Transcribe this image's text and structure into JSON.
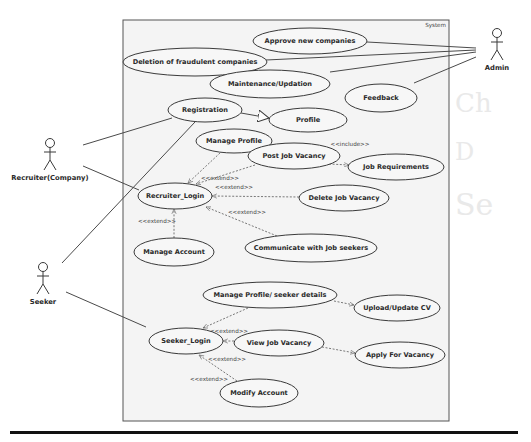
{
  "diagram": {
    "type": "uml-use-case",
    "system": {
      "label": "System",
      "box": {
        "x": 123,
        "y": 20,
        "w": 326,
        "h": 401
      }
    },
    "actors": [
      {
        "id": "admin",
        "label": "Admin",
        "x": 497,
        "y": 28
      },
      {
        "id": "recruiter",
        "label": "Recruiter(Company)",
        "x": 50,
        "y": 138
      },
      {
        "id": "seeker",
        "label": "Seeker",
        "x": 43,
        "y": 262
      }
    ],
    "use_cases": [
      {
        "id": "approve",
        "label": "Approve new companies",
        "cx": 310,
        "cy": 41,
        "rx": 57,
        "ry": 13
      },
      {
        "id": "deletion",
        "label": "Deletion of fraudulent companies",
        "cx": 195,
        "cy": 62,
        "rx": 72,
        "ry": 14
      },
      {
        "id": "maintenance",
        "label": "Maintenance/Updation",
        "cx": 270,
        "cy": 84,
        "rx": 60,
        "ry": 14
      },
      {
        "id": "feedback",
        "label": "Feedback",
        "cx": 381,
        "cy": 98,
        "rx": 36,
        "ry": 14
      },
      {
        "id": "registration",
        "label": "Registration",
        "cx": 205,
        "cy": 110,
        "rx": 37,
        "ry": 12
      },
      {
        "id": "profile",
        "label": "Profile",
        "cx": 308,
        "cy": 120,
        "rx": 39,
        "ry": 12
      },
      {
        "id": "manage_profile",
        "label": "Manage Profile",
        "cx": 234,
        "cy": 141,
        "rx": 38,
        "ry": 12
      },
      {
        "id": "post_job",
        "label": "Post Job Vacancy",
        "cx": 294,
        "cy": 156,
        "rx": 46,
        "ry": 13
      },
      {
        "id": "job_req",
        "label": "Job Requirements",
        "cx": 396,
        "cy": 167,
        "rx": 48,
        "ry": 13
      },
      {
        "id": "recruiter_login",
        "label": "Recruiter_Login",
        "cx": 175,
        "cy": 196,
        "rx": 37,
        "ry": 13
      },
      {
        "id": "delete_job",
        "label": "Delete Job Vacancy",
        "cx": 344,
        "cy": 198,
        "rx": 45,
        "ry": 13
      },
      {
        "id": "manage_account",
        "label": "Manage Account",
        "cx": 174,
        "cy": 252,
        "rx": 40,
        "ry": 14
      },
      {
        "id": "communicate",
        "label": "Communicate with Job seekers",
        "cx": 311,
        "cy": 248,
        "rx": 66,
        "ry": 14
      },
      {
        "id": "seeker_profile",
        "label": "Manage Profile/ seeker details",
        "cx": 270,
        "cy": 295,
        "rx": 67,
        "ry": 13
      },
      {
        "id": "upload_cv",
        "label": "Upload/Update CV",
        "cx": 397,
        "cy": 308,
        "rx": 43,
        "ry": 13
      },
      {
        "id": "seeker_login",
        "label": "Seeker_Login",
        "cx": 186,
        "cy": 341,
        "rx": 37,
        "ry": 13
      },
      {
        "id": "view_job",
        "label": "View Job Vacancy",
        "cx": 279,
        "cy": 343,
        "rx": 45,
        "ry": 13
      },
      {
        "id": "apply",
        "label": "Apply For Vacancy",
        "cx": 400,
        "cy": 355,
        "rx": 45,
        "ry": 13
      },
      {
        "id": "modify_account",
        "label": "Modify Account",
        "cx": 259,
        "cy": 393,
        "rx": 39,
        "ry": 14
      }
    ],
    "associations": [
      {
        "from": "admin",
        "to": "approve",
        "x1": 476,
        "y1": 48,
        "x2": 367,
        "y2": 42
      },
      {
        "from": "admin",
        "to": "deletion",
        "x1": 476,
        "y1": 50,
        "x2": 266,
        "y2": 60
      },
      {
        "from": "admin",
        "to": "maintenance",
        "x1": 476,
        "y1": 52,
        "x2": 330,
        "y2": 72
      },
      {
        "from": "admin",
        "to": "feedback",
        "x1": 476,
        "y1": 57,
        "x2": 414,
        "y2": 83
      },
      {
        "from": "recruiter",
        "to": "registration",
        "x1": 83,
        "y1": 145,
        "x2": 172,
        "y2": 118
      },
      {
        "from": "recruiter",
        "to": "recruiter_login",
        "x1": 83,
        "y1": 166,
        "x2": 139,
        "y2": 190
      },
      {
        "from": "seeker",
        "to": "registration",
        "x1": 62,
        "y1": 263,
        "x2": 195,
        "y2": 122
      },
      {
        "from": "seeker",
        "to": "seeker_login",
        "x1": 66,
        "y1": 292,
        "x2": 146,
        "y2": 327
      }
    ],
    "generalizations": [
      {
        "from": "registration",
        "to": "profile",
        "x1": 241,
        "y1": 113,
        "x2": 269,
        "y2": 118
      }
    ],
    "dependencies": [
      {
        "from": "manage_profile",
        "to": "recruiter_login",
        "stereotype": "<<extend>>",
        "x1": 220,
        "y1": 153,
        "x2": 188,
        "y2": 183,
        "lx": 220,
        "ly": 180
      },
      {
        "from": "post_job",
        "to": "recruiter_login",
        "stereotype": "",
        "x1": 255,
        "y1": 165,
        "x2": 196,
        "y2": 184,
        "lx": 0,
        "ly": 0
      },
      {
        "from": "post_job",
        "to": "job_req",
        "stereotype": "<<include>>",
        "x1": 329,
        "y1": 164,
        "x2": 349,
        "y2": 165,
        "lx": 350,
        "ly": 146
      },
      {
        "from": "delete_job",
        "to": "recruiter_login",
        "stereotype": "<<extend>>",
        "x1": 299,
        "y1": 197,
        "x2": 212,
        "y2": 196,
        "lx": 234,
        "ly": 189
      },
      {
        "from": "communicate",
        "to": "recruiter_login",
        "stereotype": "<<extend>>",
        "x1": 277,
        "y1": 236,
        "x2": 206,
        "y2": 207,
        "lx": 247,
        "ly": 214
      },
      {
        "from": "manage_account",
        "to": "recruiter_login",
        "stereotype": "<<extend>>",
        "x1": 174,
        "y1": 238,
        "x2": 174,
        "y2": 209,
        "lx": 157,
        "ly": 223
      },
      {
        "from": "seeker_profile",
        "to": "seeker_login",
        "stereotype": "",
        "x1": 248,
        "y1": 308,
        "x2": 203,
        "y2": 328,
        "lx": 0,
        "ly": 0
      },
      {
        "from": "seeker_profile",
        "to": "upload_cv",
        "stereotype": "",
        "x1": 334,
        "y1": 301,
        "x2": 354,
        "y2": 305,
        "lx": 0,
        "ly": 0
      },
      {
        "from": "view_job",
        "to": "seeker_login",
        "stereotype": "<<extend>>",
        "x1": 234,
        "y1": 341,
        "x2": 223,
        "y2": 341,
        "lx": 229,
        "ly": 333
      },
      {
        "from": "view_job",
        "to": "apply",
        "stereotype": "",
        "x1": 322,
        "y1": 347,
        "x2": 355,
        "y2": 353,
        "lx": 0,
        "ly": 0
      },
      {
        "from": "modify_account",
        "to": "seeker_login",
        "stereotype": "<<extend>>",
        "x1": 237,
        "y1": 381,
        "x2": 199,
        "y2": 355,
        "lx": 227,
        "ly": 361
      },
      {
        "from": "modify_account",
        "to": "seeker_login",
        "stereotype": "<<extend>>",
        "x1": 0,
        "y1": 0,
        "x2": 0,
        "y2": 0,
        "lx": 209,
        "ly": 381
      }
    ],
    "colors": {
      "ellipse_fill": "#f7f7f7",
      "stroke": "#3a3a3a",
      "system_fill": "#f4f4f4",
      "rule": "#111111"
    }
  }
}
